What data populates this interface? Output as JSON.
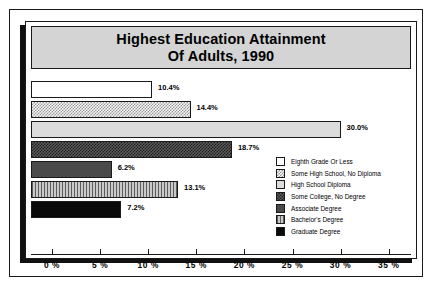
{
  "chart_data": {
    "type": "bar",
    "orientation": "horizontal",
    "title": "Highest Education Attainment Of Adults, 1990",
    "title_lines": [
      "Highest Education Attainment",
      "Of Adults, 1990"
    ],
    "xlabel": "",
    "ylabel": "",
    "xlim": [
      0,
      35
    ],
    "grid": false,
    "legend_position": "middle-right",
    "tick_labels": [
      "0 %",
      "5 %",
      "10 %",
      "15 %",
      "20 %",
      "25 %",
      "30 %",
      "35 %"
    ],
    "tick_values": [
      0,
      5,
      10,
      15,
      20,
      25,
      30,
      35
    ],
    "categories": [
      "Eighth Grade Or Less",
      "Some High School, No Diploma",
      "High School Diploma",
      "Some College, No Degree",
      "Associate Degree",
      "Bachelor's Degree",
      "Graduate Degree"
    ],
    "values": [
      10.4,
      14.4,
      30.0,
      18.7,
      6.2,
      13.1,
      7.2
    ],
    "data_labels": [
      "10.4%",
      "14.4%",
      "30.0%",
      "18.7%",
      "6.2%",
      "13.1%",
      "7.2%"
    ],
    "bars": [
      {
        "label": "Eighth Grade Or Less",
        "value": 10.4,
        "data_label": "10.4%",
        "pattern": "white",
        "swatch": "white-square-icon"
      },
      {
        "label": "Some High School, No Diploma",
        "value": 14.4,
        "data_label": "14.4%",
        "pattern": "checkl",
        "swatch": "light-checker-square-icon"
      },
      {
        "label": "High School Diploma",
        "value": 30.0,
        "data_label": "30.0%",
        "pattern": "lgray",
        "swatch": "light-gray-square-icon"
      },
      {
        "label": "Some College, No Degree",
        "value": 18.7,
        "data_label": "18.7%",
        "pattern": "checkd",
        "swatch": "dark-checker-square-icon"
      },
      {
        "label": "Associate Degree",
        "value": 6.2,
        "data_label": "6.2%",
        "pattern": "dgray",
        "swatch": "dark-gray-square-icon"
      },
      {
        "label": "Bachelor's Degree",
        "value": 13.1,
        "data_label": "13.1%",
        "pattern": "vstripe",
        "swatch": "striped-square-icon"
      },
      {
        "label": "Graduate Degree",
        "value": 7.2,
        "data_label": "7.2%",
        "pattern": "black",
        "swatch": "black-square-icon"
      }
    ]
  },
  "colors": {
    "title_band": "#d4d4d4",
    "frame": "#1a1a1a",
    "background": "#ffffff",
    "shadow": "#111111"
  }
}
